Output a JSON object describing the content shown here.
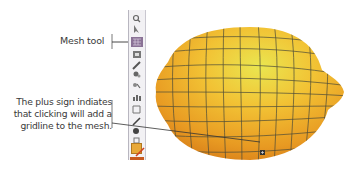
{
  "callouts": {
    "mesh_tool": "Mesh tool",
    "plus_sign": [
      "The plus sign indiates",
      "that clicking will add a",
      "gridline to the mesh."
    ]
  },
  "toolbar": {
    "tools": [
      "zoom-tool",
      "direct-selection-tool",
      "mesh-tool",
      "gradient-tool",
      "eyedropper-tool",
      "blend-tool",
      "symbol-sprayer-tool",
      "column-graph-tool",
      "slice-tool",
      "eraser-tool",
      "hand-tool",
      "zoom-tool-2"
    ],
    "active_tool": "mesh-tool",
    "fill_color": "#e8a838",
    "stroke_color": "#d04020"
  },
  "colors": {
    "lemon_light": "#e6e23a",
    "lemon_mid": "#f0b52a",
    "lemon_dark": "#e08a1c",
    "gridline": "#4a4a3a"
  }
}
